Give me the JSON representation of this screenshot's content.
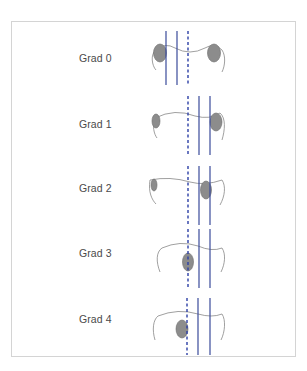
{
  "figure": {
    "colors": {
      "frame": "#d4d4d4",
      "axis_line": "#3a4a9a",
      "dashed_line": "#2c3fa6",
      "contour": "#888888",
      "condyle_fill": "#8c8c8c",
      "condyle_stroke": "#6a6a6a",
      "label_text": "#4a4a4a"
    },
    "grades": [
      {
        "label": "Grad 0",
        "label_y": 52
      },
      {
        "label": "Grad 1",
        "label_y": 118
      },
      {
        "label": "Grad 2",
        "label_y": 182
      },
      {
        "label": "Grad 3",
        "label_y": 247
      },
      {
        "label": "Grad 4",
        "label_y": 313
      }
    ]
  }
}
